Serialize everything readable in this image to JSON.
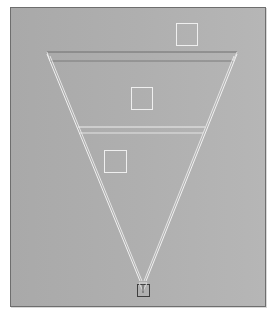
{
  "viewport": {
    "description": "Top view of a camera frustum with three square markers",
    "background_left": "#a9a9a9",
    "background_right": "#b6b6b6",
    "border_color": "#6e6e6e"
  },
  "colors": {
    "frustum_edge": "#f2f2f2",
    "far_plane_edge": "#7a7a7a",
    "marker": "#eeeeee",
    "camera": "#4a4a4a"
  },
  "icons": {
    "camera": "camera-icon",
    "marker": "square-marker-icon"
  },
  "markers": [
    {
      "name": "marker-1",
      "x": 176,
      "y": 23,
      "size": 22
    },
    {
      "name": "marker-2",
      "x": 131,
      "y": 87,
      "size": 22
    },
    {
      "name": "marker-3",
      "x": 104,
      "y": 150,
      "size": 22
    }
  ]
}
